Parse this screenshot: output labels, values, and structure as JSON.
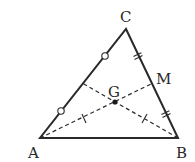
{
  "diagram": {
    "type": "triangle-centroid",
    "colors": {
      "stroke": "#2a2a2a",
      "background": "#ffffff"
    },
    "vertices": {
      "A": {
        "label": "A",
        "x": 40,
        "y": 138
      },
      "B": {
        "label": "B",
        "x": 178,
        "y": 138
      },
      "C": {
        "label": "C",
        "x": 126,
        "y": 29
      }
    },
    "points": {
      "M": {
        "label": "M",
        "x": 152,
        "y": 83.5,
        "desc": "midpoint of BC"
      },
      "G": {
        "label": "G",
        "x": 114.7,
        "y": 101.7,
        "desc": "centroid"
      },
      "N": {
        "label": "",
        "x": 83,
        "y": 83.5,
        "desc": "midpoint of AC"
      }
    },
    "medians": [
      "A-M",
      "B-N"
    ],
    "markings": {
      "AC_halves": "circle",
      "BC_halves": "double-tick",
      "AG_BG": "single-tick"
    }
  }
}
